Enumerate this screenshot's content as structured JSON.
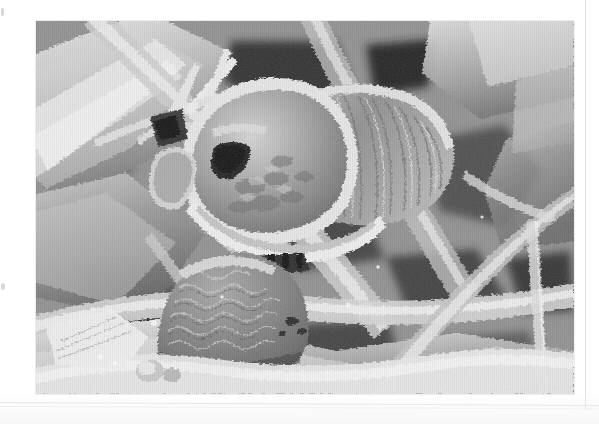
{
  "document": {
    "page_background": "#ffffff",
    "kind": "scanned-page"
  },
  "figure": {
    "name": "sem-micrograph",
    "modality": "grayscale scanning electron micrograph",
    "position": {
      "x": 36,
      "y": 21,
      "width": 538,
      "height": 373
    },
    "tone": {
      "background_gray": "#8d8d8d",
      "highlight_gray": "#f2f2f2",
      "midtone_gray": "#9a9a9a",
      "shadow_gray": "#3a3a3a",
      "deep_shadow_gray": "#1d1d1d"
    },
    "subjects": [
      {
        "label": "insect-head",
        "description": "rounded head capsule with dark oval aperture"
      },
      {
        "label": "mouthparts",
        "description": "ridged striated palp region to the right of the head"
      },
      {
        "label": "dark-aperture",
        "description": "dark triangular opening within the head capsule"
      },
      {
        "label": "textured-sphere",
        "description": "scale-patterned rounded body below the head"
      },
      {
        "label": "spine-cluster",
        "description": "branching spines at upper left of frame"
      },
      {
        "label": "fibre-bundle",
        "description": "overlapping ribbon-like fibres filling the field"
      }
    ]
  },
  "page_marks": {
    "vertical_rule_color": "#e2e2e4",
    "horizontal_rule_color": "#e4e4e6",
    "speck_color": "#d8d8da"
  }
}
